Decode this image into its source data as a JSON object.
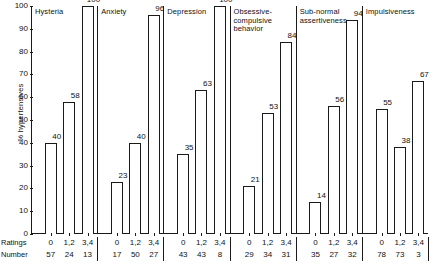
{
  "chart_data": {
    "type": "bar",
    "title": "",
    "xlabel": "",
    "ylabel": "% hypertensives",
    "ylim": [
      0,
      100
    ],
    "ytick_labels": [
      "0",
      "10",
      "20",
      "30",
      "40",
      "50",
      "60",
      "70",
      "80",
      "90",
      "100"
    ],
    "ytick_values": [
      0,
      10,
      20,
      30,
      40,
      50,
      60,
      70,
      80,
      90,
      100
    ],
    "grid": false,
    "legend": null,
    "row_labels": {
      "ratings": "Ratings",
      "number": "Number"
    },
    "categories": [
      "0",
      "1,2",
      "3,4"
    ],
    "panels": [
      {
        "title": "Hysteria",
        "values": [
          40,
          58,
          100
        ],
        "ratings": [
          "0",
          "1,2",
          "3,4"
        ],
        "numbers": [
          57,
          24,
          13
        ]
      },
      {
        "title": "Anxiety",
        "values": [
          23,
          40,
          96
        ],
        "ratings": [
          "0",
          "1,2",
          "3,4"
        ],
        "numbers": [
          17,
          50,
          27
        ]
      },
      {
        "title": "Depression",
        "values": [
          35,
          63,
          100
        ],
        "ratings": [
          "0",
          "1,2",
          "3,4"
        ],
        "numbers": [
          43,
          43,
          8
        ]
      },
      {
        "title": "Obsessive-\ncompulsive\nbehavior",
        "values": [
          21,
          53,
          84
        ],
        "ratings": [
          "0",
          "1,2",
          "3,4"
        ],
        "numbers": [
          29,
          34,
          31
        ]
      },
      {
        "title": "Sub-normal\nassertiveness",
        "values": [
          14,
          56,
          94
        ],
        "ratings": [
          "0",
          "1,2",
          "3,4"
        ],
        "numbers": [
          35,
          27,
          32
        ]
      },
      {
        "title": "Impulsiveness",
        "values": [
          55,
          38,
          67
        ],
        "ratings": [
          "0",
          "1,2",
          "3,4"
        ],
        "numbers": [
          78,
          73,
          3
        ]
      }
    ],
    "colors": {
      "bar_fill": "#ffffff",
      "bar_stroke": "#1a1a1a",
      "axis": "#1a1a1a",
      "text": "#111111"
    }
  }
}
